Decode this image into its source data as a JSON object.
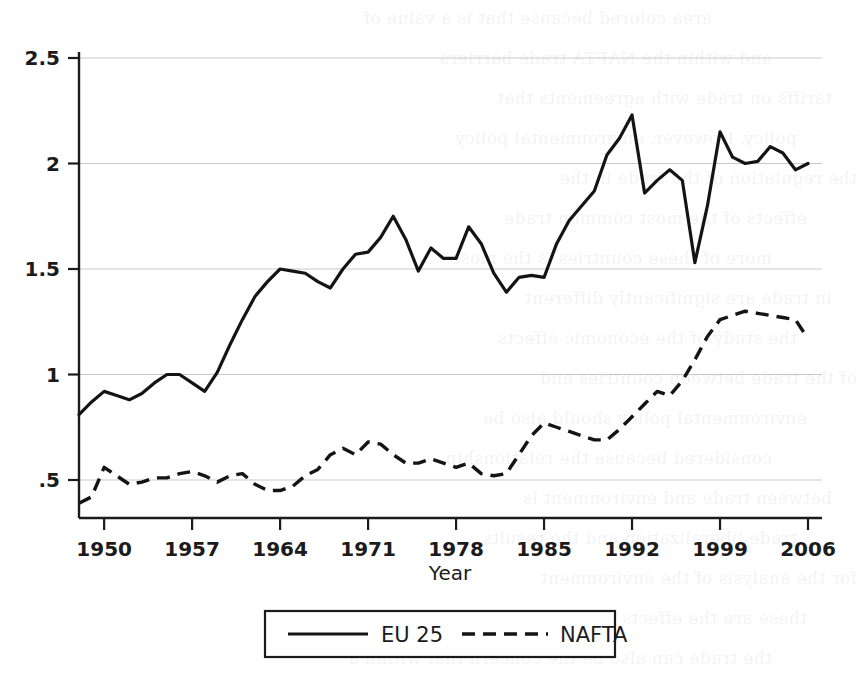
{
  "chart_data": {
    "type": "line",
    "title": "",
    "xlabel": "Year",
    "ylabel": "",
    "xlim": [
      1948,
      2006
    ],
    "ylim": [
      0.29,
      2.62
    ],
    "grid": "horizontal",
    "legend_position": "below-center",
    "xticks": [
      1950,
      1957,
      1964,
      1971,
      1978,
      1985,
      1992,
      1999,
      2006
    ],
    "xticklabels": [
      "1950",
      "1957",
      "1964",
      "1971",
      "1978",
      "1985",
      "1992",
      "1999",
      "2006"
    ],
    "yticks": [
      0.5,
      1,
      1.5,
      2,
      2.5
    ],
    "yticklabels": [
      ".5",
      "1",
      "1.5",
      "2",
      "2.5"
    ],
    "x": [
      1948,
      1949,
      1950,
      1951,
      1952,
      1953,
      1954,
      1955,
      1956,
      1957,
      1958,
      1959,
      1960,
      1961,
      1962,
      1963,
      1964,
      1965,
      1966,
      1967,
      1968,
      1969,
      1970,
      1971,
      1972,
      1973,
      1974,
      1975,
      1976,
      1977,
      1978,
      1979,
      1980,
      1981,
      1982,
      1983,
      1984,
      1985,
      1986,
      1987,
      1988,
      1989,
      1990,
      1991,
      1992,
      1993,
      1994,
      1995,
      1996,
      1997,
      1998,
      1999,
      2000,
      2001,
      2002,
      2003,
      2004,
      2005,
      2006
    ],
    "series": [
      {
        "name": "EU 25",
        "style": "solid",
        "color": "#141414",
        "values": [
          0.81,
          0.87,
          0.92,
          0.9,
          0.88,
          0.91,
          0.96,
          1.0,
          1.0,
          0.96,
          0.92,
          1.01,
          1.14,
          1.26,
          1.37,
          1.44,
          1.5,
          1.49,
          1.48,
          1.44,
          1.41,
          1.5,
          1.57,
          1.58,
          1.65,
          1.75,
          1.64,
          1.49,
          1.6,
          1.55,
          1.55,
          1.7,
          1.62,
          1.48,
          1.39,
          1.46,
          1.47,
          1.46,
          1.62,
          1.73,
          1.8,
          1.87,
          2.04,
          2.12,
          2.23,
          1.86,
          1.92,
          1.97,
          1.92,
          1.53,
          1.8,
          2.15,
          2.03,
          2.0,
          2.01,
          2.08,
          2.05,
          1.97,
          2.0
        ]
      },
      {
        "name": "NAFTA",
        "style": "dashed",
        "color": "#141414",
        "values": [
          0.39,
          0.42,
          0.56,
          0.52,
          0.48,
          0.49,
          0.51,
          0.51,
          0.53,
          0.54,
          0.52,
          0.49,
          0.52,
          0.53,
          0.48,
          0.45,
          0.45,
          0.47,
          0.52,
          0.55,
          0.62,
          0.65,
          0.62,
          0.68,
          0.67,
          0.62,
          0.58,
          0.58,
          0.6,
          0.58,
          0.56,
          0.58,
          0.53,
          0.52,
          0.53,
          0.62,
          0.71,
          0.77,
          0.75,
          0.73,
          0.71,
          0.69,
          0.69,
          0.74,
          0.8,
          0.86,
          0.92,
          0.9,
          0.97,
          1.07,
          1.18,
          1.26,
          1.28,
          1.3,
          1.29,
          1.28,
          1.27,
          1.26,
          1.17
        ]
      }
    ]
  },
  "legend": {
    "items": [
      {
        "label": "EU 25",
        "style": "solid"
      },
      {
        "label": "NAFTA",
        "style": "dashed"
      }
    ]
  },
  "axis": {
    "x_title": "Year"
  },
  "background_ghost_text": [
    "area colored because that is a value of",
    "and within the NAFTA trade barriers",
    "tariffs on trade with agreements that",
    "policy. However, environmental policy",
    "the regulation of the trade in the",
    "effects of the most common trade",
    "more of these countries is the most",
    "in trade are significantly different",
    "the study of the economic effects",
    "of the trade between countries and",
    "environmental policy should also be",
    "considered because the relationship",
    "between trade and environment is",
    "trade liberalization and the results",
    "for the analysis of the environment",
    "these are the effects are important",
    "the trade can also be the concern that within a"
  ]
}
